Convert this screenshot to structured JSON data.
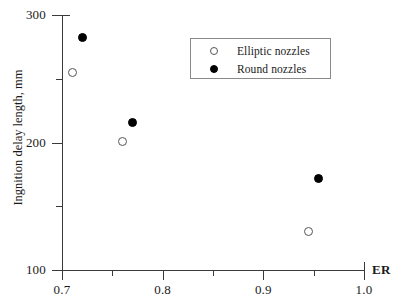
{
  "chart_data": {
    "type": "scatter",
    "title": "",
    "xlabel": "ER",
    "ylabel": "Ingnition delay length, mm",
    "xlim": [
      0.7,
      1.0
    ],
    "ylim": [
      100,
      300
    ],
    "grid": false,
    "legend_position": "top-right-inside",
    "x_ticks_major": [
      {
        "value": 0.7,
        "label": "0.7"
      },
      {
        "value": 0.8,
        "label": "0.8"
      },
      {
        "value": 0.9,
        "label": "0.9"
      },
      {
        "value": 1.0,
        "label": "1.0"
      }
    ],
    "x_ticks_minor": [
      0.75,
      0.85,
      0.95
    ],
    "y_ticks_major": [
      {
        "value": 300,
        "label": "300"
      },
      {
        "value": 200,
        "label": "200"
      },
      {
        "value": 100,
        "label": "100"
      }
    ],
    "y_ticks_minor": [
      250,
      150
    ],
    "series": [
      {
        "name": "Elliptic nozzles",
        "marker": "open-circle",
        "color": "#555555",
        "points": [
          {
            "x": 0.71,
            "y": 255
          },
          {
            "x": 0.76,
            "y": 201
          },
          {
            "x": 0.945,
            "y": 130
          }
        ]
      },
      {
        "name": "Round nozzles",
        "marker": "filled-circle",
        "color": "#000000",
        "points": [
          {
            "x": 0.72,
            "y": 282
          },
          {
            "x": 0.77,
            "y": 216
          },
          {
            "x": 0.955,
            "y": 172
          }
        ]
      }
    ]
  },
  "legend": {
    "entries": [
      {
        "label": "Elliptic nozzles",
        "marker": "open-circle"
      },
      {
        "label": "Round nozzles",
        "marker": "filled-circle"
      }
    ]
  }
}
